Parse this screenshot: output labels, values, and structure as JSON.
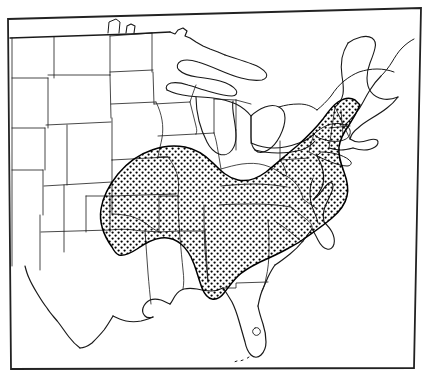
{
  "figure": {
    "kind": "range-map",
    "caption_clipped": "C.1.1.1.",
    "background_color": "#ffffff",
    "ink_color": "#1a1a1a"
  },
  "map": {
    "title": "",
    "region": "Eastern United States",
    "projection_note": "frame slightly rotated (scan skew)",
    "frame": {
      "stroke_color": "#222222",
      "stroke_width": 1.6,
      "corners": {
        "top_left": [
          8,
          19
        ],
        "top_right": [
          421,
          8
        ],
        "bottom_right": [
          414,
          368
        ],
        "bottom_left": [
          11,
          369
        ]
      }
    },
    "outline": {
      "stroke_color": "#1a1a1a",
      "coast_stroke_width": 1.3,
      "state_stroke_width": 0.7
    },
    "range": {
      "label": "species distribution",
      "fill_pattern": "stipple",
      "dot_color": "#000000",
      "dot_radius": 1.15,
      "dot_spacing": 6,
      "boundary_stroke_width": 1.5,
      "boundary_color": "#000000",
      "coverage_note": "mid-Atlantic, Southeast, Ohio valley, lower Midwest; absent from Florida peninsula, Gulf coastal plain, New England and all states west of the Great Plains"
    },
    "features": [
      {
        "name": "Great Lakes",
        "type": "water-body",
        "present": true
      },
      {
        "name": "Chesapeake Bay",
        "type": "water-body",
        "present": true
      },
      {
        "name": "Lake Okeechobee",
        "type": "water-body",
        "present": true
      },
      {
        "name": "Long Island",
        "type": "island",
        "present": true
      },
      {
        "name": "Florida Keys",
        "type": "island-chain",
        "present": true
      },
      {
        "name": "Cape Cod",
        "type": "headland",
        "present": true
      },
      {
        "name": "state boundaries",
        "type": "political",
        "present": true
      }
    ],
    "legend": {
      "visible": false,
      "items": []
    },
    "scale_bar": {
      "visible": false
    },
    "north_arrow": {
      "visible": false
    }
  }
}
